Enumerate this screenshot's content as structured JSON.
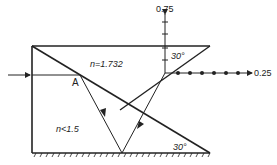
{
  "diagram": {
    "type": "optics-prism-ray-diagram",
    "labels": {
      "upper_medium": "n=1.732",
      "lower_medium": "n<1.5",
      "point_a": "A",
      "angle_top": "30°",
      "angle_bottom": "30°",
      "axis_vertical": "0.75",
      "axis_horizontal": "0.25"
    },
    "colors": {
      "line": "#222222",
      "background": "#ffffff"
    }
  }
}
